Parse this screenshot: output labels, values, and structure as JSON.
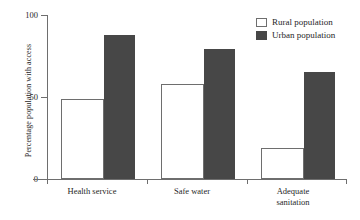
{
  "chart_data": {
    "type": "bar",
    "title": "",
    "xlabel": "",
    "ylabel": "Percentage population with access",
    "ylim": [
      0,
      100
    ],
    "yticks": [
      "0",
      "50",
      "100"
    ],
    "grid": false,
    "legend_position": "top-right",
    "categories": [
      "Health service",
      "Safe water",
      "Adequate sanitation"
    ],
    "category_lines": [
      [
        "Health service"
      ],
      [
        "Safe water"
      ],
      [
        "Adequate",
        "sanitation"
      ]
    ],
    "series": [
      {
        "name": "Rural population",
        "color": "#ffffff",
        "values": [
          49,
          58,
          19
        ]
      },
      {
        "name": "Urban population",
        "color": "#474747",
        "values": [
          88,
          79,
          65
        ]
      }
    ]
  },
  "legend": {
    "items": [
      {
        "label": "Rural population",
        "swatch": "rural"
      },
      {
        "label": "Urban population",
        "swatch": "urban"
      }
    ]
  },
  "axis": {
    "y_title": "Percentage population with access",
    "y_tick_100": "100",
    "y_tick_50": "50",
    "y_tick_0": "0"
  },
  "categories": {
    "c0_line1": "Health service",
    "c1_line1": "Safe water",
    "c2_line1": "Adequate",
    "c2_line2": "sanitation"
  }
}
